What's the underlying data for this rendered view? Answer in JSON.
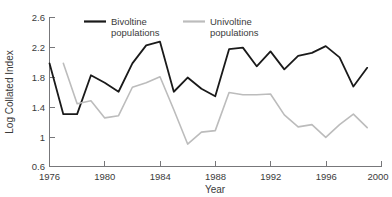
{
  "chart_data": {
    "type": "line",
    "title": "",
    "xlabel": "Year",
    "ylabel": "Log Collated Index",
    "xlim": [
      1976,
      2000
    ],
    "ylim": [
      0.6,
      2.6
    ],
    "xticks": [
      1976,
      1980,
      1984,
      1988,
      1992,
      1996,
      2000
    ],
    "yticks": [
      0.6,
      1,
      1.4,
      1.8,
      2.2,
      2.6
    ],
    "xticklabels": [
      "1976",
      "1980",
      "1984",
      "1988",
      "1992",
      "1996",
      "2000"
    ],
    "yticklabels": [
      "0.6",
      "1",
      "1.4",
      "1.8",
      "2.2",
      "2.6"
    ],
    "grid": false,
    "legend_position": "top-center",
    "series": [
      {
        "name": "Bivoltine populations",
        "color": "#1a1a1a",
        "x": [
          1976,
          1977,
          1978,
          1979,
          1980,
          1981,
          1982,
          1983,
          1984,
          1985,
          1986,
          1987,
          1988,
          1989,
          1990,
          1991,
          1992,
          1993,
          1994,
          1995,
          1996,
          1997,
          1998,
          1999
        ],
        "values": [
          1.98,
          1.3,
          1.3,
          1.82,
          1.72,
          1.6,
          1.98,
          2.22,
          2.27,
          1.6,
          1.79,
          1.64,
          1.54,
          2.17,
          2.19,
          1.94,
          2.14,
          1.9,
          2.08,
          2.12,
          2.21,
          2.06,
          1.67,
          1.92
        ]
      },
      {
        "name": "Univoltine populations",
        "color": "#bcbcbc",
        "x": [
          1977,
          1978,
          1979,
          1980,
          1981,
          1982,
          1983,
          1984,
          1985,
          1986,
          1987,
          1988,
          1989,
          1990,
          1991,
          1992,
          1993,
          1994,
          1995,
          1996,
          1997,
          1998,
          1999
        ],
        "values": [
          1.98,
          1.44,
          1.48,
          1.25,
          1.28,
          1.66,
          1.72,
          1.8,
          1.36,
          0.9,
          1.06,
          1.08,
          1.59,
          1.56,
          1.56,
          1.57,
          1.29,
          1.13,
          1.16,
          0.99,
          1.16,
          1.3,
          1.12
        ]
      }
    ]
  },
  "legend": {
    "items": [
      {
        "label_line1": "Bivoltine",
        "label_line2": "populations",
        "color": "#1a1a1a"
      },
      {
        "label_line1": "Univoltine",
        "label_line2": "populations",
        "color": "#bcbcbc"
      }
    ]
  },
  "axes": {
    "x_title": "Year",
    "y_title": "Log Collated Index"
  }
}
